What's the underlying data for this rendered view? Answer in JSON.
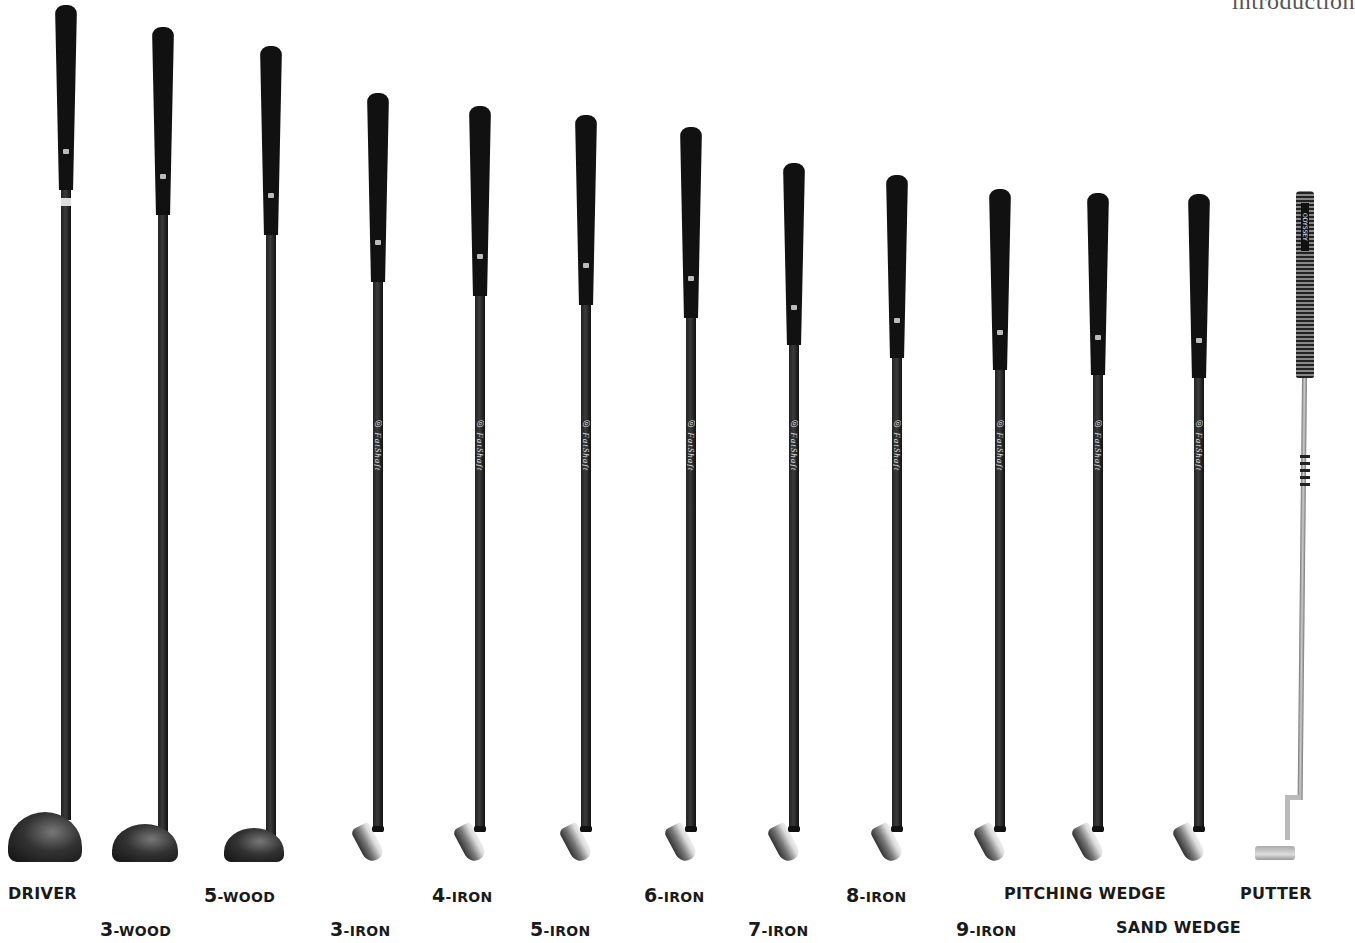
{
  "header": {
    "section_title": "introduction"
  },
  "shaft_brand": "FatShaft",
  "putter_grip_brand": "ODYSSEY",
  "clubs": [
    {
      "id": "driver",
      "label": "DRIVER",
      "num": "",
      "rest": "DRIVER",
      "type": "wood",
      "x": 66,
      "grip_top": 5,
      "grip_bottom": 190,
      "head_bottom": 862,
      "head_w": 74,
      "head_h": 50,
      "label_x": 8,
      "label_y": 884
    },
    {
      "id": "3-wood",
      "label": "3-WOOD",
      "num": "3",
      "rest": "-WOOD",
      "type": "wood",
      "x": 163,
      "grip_top": 27,
      "grip_bottom": 215,
      "head_bottom": 862,
      "head_w": 66,
      "head_h": 38,
      "label_x": 100,
      "label_y": 918
    },
    {
      "id": "5-wood",
      "label": "5-WOOD",
      "num": "5",
      "rest": "-WOOD",
      "type": "wood",
      "x": 271,
      "grip_top": 46,
      "grip_bottom": 235,
      "head_bottom": 862,
      "head_w": 60,
      "head_h": 34,
      "label_x": 204,
      "label_y": 884
    },
    {
      "id": "3-iron",
      "label": "3-IRON",
      "num": "3",
      "rest": "-IRON",
      "type": "iron",
      "x": 378,
      "grip_top": 93,
      "grip_bottom": 282,
      "head_bottom": 862,
      "label_x": 330,
      "label_y": 918
    },
    {
      "id": "4-iron",
      "label": "4-IRON",
      "num": "4",
      "rest": "-IRON",
      "type": "iron",
      "x": 480,
      "grip_top": 106,
      "grip_bottom": 296,
      "head_bottom": 862,
      "label_x": 432,
      "label_y": 884
    },
    {
      "id": "5-iron",
      "label": "5-IRON",
      "num": "5",
      "rest": "-IRON",
      "type": "iron",
      "x": 586,
      "grip_top": 115,
      "grip_bottom": 305,
      "head_bottom": 862,
      "label_x": 530,
      "label_y": 918
    },
    {
      "id": "6-iron",
      "label": "6-IRON",
      "num": "6",
      "rest": "-IRON",
      "type": "iron",
      "x": 691,
      "grip_top": 127,
      "grip_bottom": 318,
      "head_bottom": 862,
      "label_x": 644,
      "label_y": 884
    },
    {
      "id": "7-iron",
      "label": "7-IRON",
      "num": "7",
      "rest": "-IRON",
      "type": "iron",
      "x": 794,
      "grip_top": 163,
      "grip_bottom": 345,
      "head_bottom": 862,
      "label_x": 748,
      "label_y": 918
    },
    {
      "id": "8-iron",
      "label": "8-IRON",
      "num": "8",
      "rest": "-IRON",
      "type": "iron",
      "x": 897,
      "grip_top": 175,
      "grip_bottom": 358,
      "head_bottom": 862,
      "label_x": 846,
      "label_y": 884
    },
    {
      "id": "9-iron",
      "label": "9-IRON",
      "num": "9",
      "rest": "-IRON",
      "type": "iron",
      "x": 1000,
      "grip_top": 189,
      "grip_bottom": 370,
      "head_bottom": 862,
      "label_x": 956,
      "label_y": 918
    },
    {
      "id": "pitching-wedge",
      "label": "PITCHING WEDGE",
      "num": "",
      "rest": "PITCHING WEDGE",
      "type": "iron",
      "x": 1098,
      "grip_top": 193,
      "grip_bottom": 375,
      "head_bottom": 862,
      "label_x": 1004,
      "label_y": 884
    },
    {
      "id": "sand-wedge",
      "label": "SAND WEDGE",
      "num": "",
      "rest": "SAND WEDGE",
      "type": "iron",
      "x": 1199,
      "grip_top": 194,
      "grip_bottom": 378,
      "head_bottom": 862,
      "label_x": 1116,
      "label_y": 918
    },
    {
      "id": "putter",
      "label": "PUTTER",
      "num": "",
      "rest": "PUTTER",
      "type": "putter",
      "x": 1305,
      "grip_top": 191,
      "grip_bottom": 378,
      "head_bottom": 862,
      "label_x": 1240,
      "label_y": 884
    }
  ]
}
